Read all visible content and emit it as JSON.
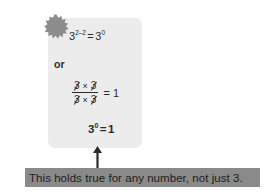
{
  "figure": {
    "type": "math-worked-example",
    "background_color": "#ffffff",
    "card": {
      "background_color": "#ececec",
      "badge": {
        "icon": "starburst-icon",
        "color": "#8c8c8c"
      },
      "lines": [
        {
          "id": "equation-exponent-form",
          "base": "3",
          "exponent": "2–2",
          "relation": "=",
          "rhs_base": "3",
          "rhs_exponent": "0",
          "text": "3^(2-2) = 3^0"
        },
        {
          "id": "or-connector",
          "text": "or"
        },
        {
          "id": "fraction-block",
          "numerator_terms": [
            "3",
            "3"
          ],
          "denominator_terms": [
            "3",
            "3"
          ],
          "times_symbol": "×",
          "cancelled": true,
          "relation": "=",
          "result": "1",
          "text": "(3 × 3) / (3 × 3) = 1"
        },
        {
          "id": "equation-final",
          "base": "3",
          "exponent": "0",
          "relation": "=",
          "result": "1",
          "text": "3^0 = 1"
        }
      ]
    },
    "arrow": {
      "direction": "up",
      "color": "#2b2b2b"
    },
    "caption": {
      "text": "This holds true for any number, not just 3.",
      "background_color": "#8a8a8a",
      "text_color": "#1c1c1c"
    }
  }
}
